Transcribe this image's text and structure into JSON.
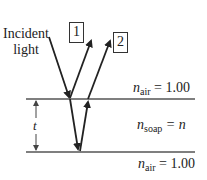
{
  "diagram": {
    "incident_label_line1": "Incident",
    "incident_label_line2": "light",
    "ray1_label": "1",
    "ray2_label": "2",
    "top_medium": {
      "symbol": "n",
      "subscript": "air",
      "equals": "= 1.00"
    },
    "film_medium": {
      "symbol": "n",
      "subscript": "soap",
      "equals": "= n"
    },
    "bottom_medium": {
      "symbol": "n",
      "subscript": "air",
      "equals": "= 1.00"
    },
    "thickness_label": "t",
    "colors": {
      "line": "#222222",
      "interface": "#555555",
      "background": "#ffffff"
    }
  }
}
